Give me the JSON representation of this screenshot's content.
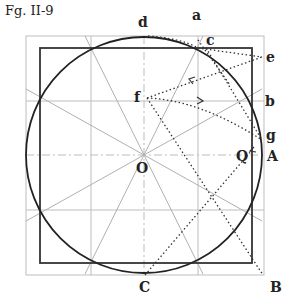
{
  "figure": {
    "caption": "Fg. II-9",
    "labels": {
      "d": "d",
      "a": "a",
      "c": "c",
      "e": "e",
      "f": "f",
      "b": "b",
      "g": "g",
      "O": "O",
      "Q": "Q",
      "A": "A",
      "C": "C",
      "B": "B"
    },
    "colors": {
      "ink": "#222222",
      "grid": "#b8b8b8"
    }
  }
}
